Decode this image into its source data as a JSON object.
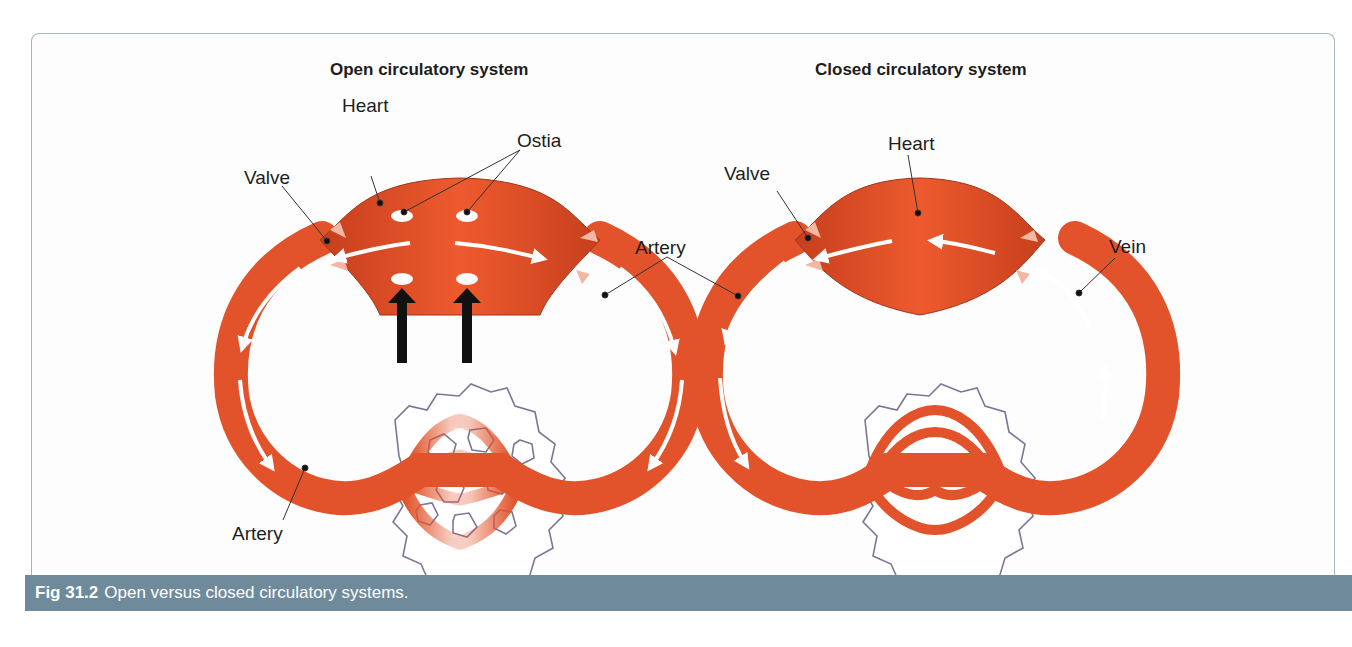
{
  "open_system": {
    "title": "Open circulatory system",
    "labels": {
      "heart": "Heart",
      "ostia": "Ostia",
      "valve": "Valve",
      "artery_right": "Artery",
      "artery_left": "Artery"
    }
  },
  "closed_system": {
    "title": "Closed circulatory system",
    "labels": {
      "heart": "Heart",
      "valve": "Valve",
      "vein": "Vein",
      "artery": "Artery"
    }
  },
  "caption": {
    "figure_number": "Fig 31.2",
    "text": "Open versus closed circulatory systems."
  },
  "colors": {
    "vessel": "#e2532b",
    "vessel_dark": "#c9401d",
    "cell_outline": "#7d7596",
    "caption_bar": "#6f8a9a"
  }
}
